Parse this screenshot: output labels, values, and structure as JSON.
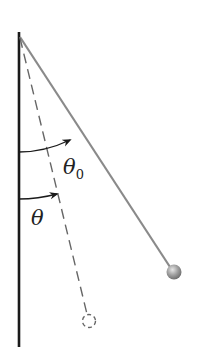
{
  "diagram": {
    "type": "pendulum",
    "labels": {
      "theta0": "θ",
      "theta0_sub": "0",
      "theta": "θ"
    },
    "colors": {
      "wall": "#1a1a1a",
      "string": "#8a8a8a",
      "dashed": "#666666",
      "bob": "#9a9a9a",
      "arc": "#1a1a1a"
    }
  }
}
